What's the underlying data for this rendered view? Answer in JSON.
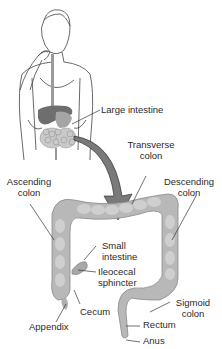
{
  "diagram": {
    "colors": {
      "background": "#ffffff",
      "organ_fill": "#b8b8b8",
      "organ_shade": "#8f8f8f",
      "organ_highlight": "#d6d6d6",
      "line": "#333333",
      "arrow": "#7a7a7a",
      "text": "#2a2a2a"
    },
    "labels": {
      "large_intestine": "Large intestine",
      "transverse_colon_1": "Transverse",
      "transverse_colon_2": "colon",
      "ascending_colon_1": "Ascending",
      "ascending_colon_2": "colon",
      "descending_colon_1": "Descending",
      "descending_colon_2": "colon",
      "small_intestine_1": "Small",
      "small_intestine_2": "intestine",
      "ileocecal_sphincter_1": "Ileocecal",
      "ileocecal_sphincter_2": "sphincter",
      "cecum": "Cecum",
      "appendix": "Appendix",
      "sigmoid_colon_1": "Sigmoid",
      "sigmoid_colon_2": "colon",
      "rectum": "Rectum",
      "anus": "Anus"
    }
  }
}
